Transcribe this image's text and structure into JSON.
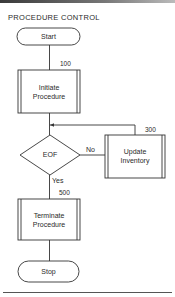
{
  "diagram": {
    "title": "PROCEDURE CONTROL",
    "nodes": {
      "start": {
        "label": "Start",
        "shape": "terminator"
      },
      "initiate": {
        "label_line1": "Initiate",
        "label_line2": "Procedure",
        "shape": "predefined-process",
        "number": "100"
      },
      "eof": {
        "label": "EOF",
        "shape": "decision"
      },
      "update": {
        "label_line1": "Update",
        "label_line2": "Inventory",
        "shape": "predefined-process",
        "number": "300"
      },
      "terminate": {
        "label_line1": "Terminate",
        "label_line2": "Procedure",
        "shape": "predefined-process",
        "number": "500"
      },
      "stop": {
        "label": "Stop",
        "shape": "terminator"
      }
    },
    "edges": {
      "no_label": "No",
      "yes_label": "Yes"
    },
    "colors": {
      "stroke": "#333333",
      "background": "#ffffff"
    }
  }
}
